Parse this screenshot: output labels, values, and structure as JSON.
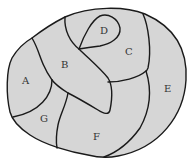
{
  "diagram": {
    "type": "map-regions",
    "fill_color": "#d6d6d6",
    "stroke_color": "#1a1a1a",
    "background": "#ffffff",
    "regions": [
      {
        "id": "A",
        "label": "A",
        "x": 25,
        "y": 84
      },
      {
        "id": "B",
        "label": "B",
        "x": 64,
        "y": 67
      },
      {
        "id": "C",
        "label": "C",
        "x": 129,
        "y": 55
      },
      {
        "id": "D",
        "label": "D",
        "x": 104,
        "y": 33
      },
      {
        "id": "E",
        "label": "E",
        "x": 168,
        "y": 91
      },
      {
        "id": "F",
        "label": "F",
        "x": 96,
        "y": 139
      },
      {
        "id": "G",
        "label": "G",
        "x": 44,
        "y": 121
      }
    ]
  }
}
